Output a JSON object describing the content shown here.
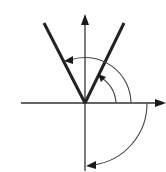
{
  "diagram": {
    "origin": [
      85,
      103
    ],
    "colors": {
      "axis": "#333333",
      "rays": "#222222",
      "arcs": "#444444",
      "background": "#ffffff"
    },
    "axes": {
      "x": {
        "from": [
          21,
          103
        ],
        "to": [
          165,
          103
        ],
        "arrow": "right"
      },
      "y": {
        "from": [
          85,
          171
        ],
        "to": [
          85,
          15
        ],
        "arrow": "up"
      }
    },
    "rays": [
      {
        "name": "left-ray",
        "end": [
          44,
          23
        ]
      },
      {
        "name": "right-ray",
        "end": [
          124,
          23
        ]
      }
    ],
    "arcs": [
      {
        "name": "small-ccw-arc",
        "radius": 31,
        "direction": "counterclockwise",
        "from": "positive-x-axis",
        "to": "right-ray"
      },
      {
        "name": "large-ccw-arc",
        "radius": 46,
        "direction": "counterclockwise",
        "from": "positive-x-axis",
        "to": "left-ray"
      },
      {
        "name": "clockwise-arc",
        "radius": 62,
        "direction": "clockwise",
        "from": "positive-x-axis",
        "to": "negative-y-axis"
      }
    ]
  }
}
